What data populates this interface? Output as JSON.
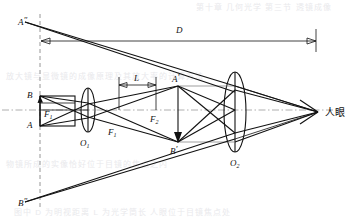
{
  "figure": {
    "type": "optics-ray-diagram",
    "stroke_color": "#111111",
    "axis_color": "#9a9a9a",
    "background": "#ffffff"
  },
  "background_text": {
    "line_top": "第十章 几何光学 第三节 透镜成像",
    "line_mid_1": "放大镜与显微镜的成像原理及其放大率的计算方法",
    "line_mid_2": "物镜所成的实像恰好位于目镜的焦点之内",
    "line_bottom": "图中 D 为明视距离 L 为光学筒长 人眼位于目镜焦点处"
  },
  "labels": {
    "a_double_prime": {
      "base": "A",
      "prime": "″",
      "x": 22,
      "y": 22
    },
    "b_double_prime": {
      "base": "B",
      "prime": "″",
      "x": 22,
      "y": 203
    },
    "b_object": {
      "base": "B",
      "prime": "",
      "x": 30,
      "y": 95
    },
    "a_object": {
      "base": "A",
      "prime": "",
      "x": 30,
      "y": 124
    },
    "f1_object_side": {
      "base": "F",
      "sub": "1",
      "prime": "",
      "x": 40,
      "y": 115
    },
    "o1": {
      "base": "O",
      "sub": "1",
      "x": 82,
      "y": 143
    },
    "f1_image_side": {
      "base": "F",
      "sub": "1",
      "prime": "",
      "x": 111,
      "y": 133
    },
    "f2": {
      "base": "F",
      "sub": "2",
      "prime": "",
      "x": 152,
      "y": 120
    },
    "a_prime": {
      "base": "A",
      "prime": "′",
      "x": 175,
      "y": 81
    },
    "b_prime": {
      "base": "B",
      "prime": "′",
      "x": 172,
      "y": 150
    },
    "o2": {
      "base": "O",
      "sub": "2",
      "x": 235,
      "y": 163
    },
    "dimension_d": {
      "base": "D",
      "x": 180,
      "y": 31
    },
    "dimension_l": {
      "base": "L",
      "x": 138,
      "y": 80
    },
    "eye": {
      "text": "人眼",
      "x": 330,
      "y": 115
    }
  },
  "geometry": {
    "optical_axis_y": 110,
    "lens1": {
      "cx": 88,
      "cy": 110,
      "rx": 7,
      "ry": 22
    },
    "lens2": {
      "cx": 235,
      "cy": 112,
      "rx": 11,
      "ry": 40
    },
    "object": {
      "x": 40,
      "top_y": 96,
      "bottom_y": 126,
      "right_x": 75
    },
    "image_intermediate": {
      "x": 178,
      "top_y": 86,
      "bottom_y": 142
    },
    "eye_point": {
      "x": 318,
      "y": 112
    },
    "virtual_image": {
      "x": 40,
      "top_y": 22,
      "bottom_y": 202
    },
    "dashed_vertical_x": 40,
    "dimension_d_y": 41,
    "dimension_d_x1": 40,
    "dimension_d_x2": 318,
    "dimension_l_y": 85,
    "dimension_l_x1": 118,
    "dimension_l_x2": 157
  }
}
